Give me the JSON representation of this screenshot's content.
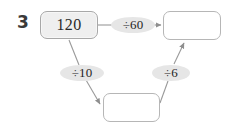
{
  "page": {
    "question_number": "3",
    "background_color": "#ffffff"
  },
  "diagram": {
    "type": "division-chain",
    "nodes": [
      {
        "id": "start",
        "label": "120",
        "filled": true,
        "fill_color": "#efefef"
      },
      {
        "id": "result",
        "label": "",
        "filled": false,
        "fill_color": "#ffffff"
      },
      {
        "id": "mid",
        "label": "",
        "filled": false,
        "fill_color": "#ffffff"
      }
    ],
    "operations": [
      {
        "id": "op-top",
        "label": "÷60",
        "from": "start",
        "to": "result",
        "bubble_color": "#e6e6e6"
      },
      {
        "id": "op-left",
        "label": "÷10",
        "from": "start",
        "to": "mid",
        "bubble_color": "#e6e6e6"
      },
      {
        "id": "op-right",
        "label": "÷6",
        "from": "mid",
        "to": "result",
        "bubble_color": "#e6e6e6"
      }
    ],
    "stroke_color": "#9a9a9a",
    "box_border_color": "#b6b6b6"
  }
}
